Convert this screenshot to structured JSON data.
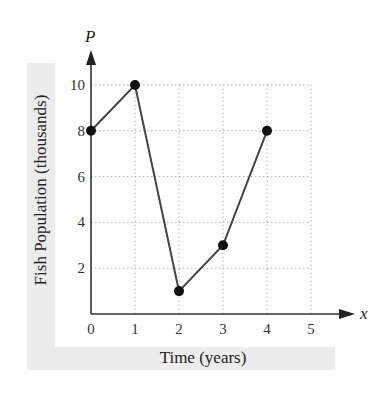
{
  "chart_data": {
    "type": "line",
    "title": "",
    "xlabel": "Time (years)",
    "ylabel": "Fish Population (thousands)",
    "x_axis_symbol": "x",
    "y_axis_symbol": "P",
    "x": [
      0,
      1,
      2,
      3,
      4
    ],
    "series": [
      {
        "name": "Fish Population",
        "values": [
          8,
          10,
          1,
          3,
          8
        ]
      }
    ],
    "x_ticks": [
      "0",
      "1",
      "2",
      "3",
      "4",
      "5"
    ],
    "y_ticks": [
      "2",
      "4",
      "6",
      "8",
      "10"
    ],
    "xlim": [
      0,
      5
    ],
    "ylim": [
      0,
      10
    ],
    "grid": true,
    "grid_style": "dotted",
    "legend": null,
    "markers": "filled-circle",
    "colors": {
      "line": "#444444",
      "marker": "#111111",
      "grid": "#b0b0b0",
      "label_band": "#ececec"
    }
  }
}
